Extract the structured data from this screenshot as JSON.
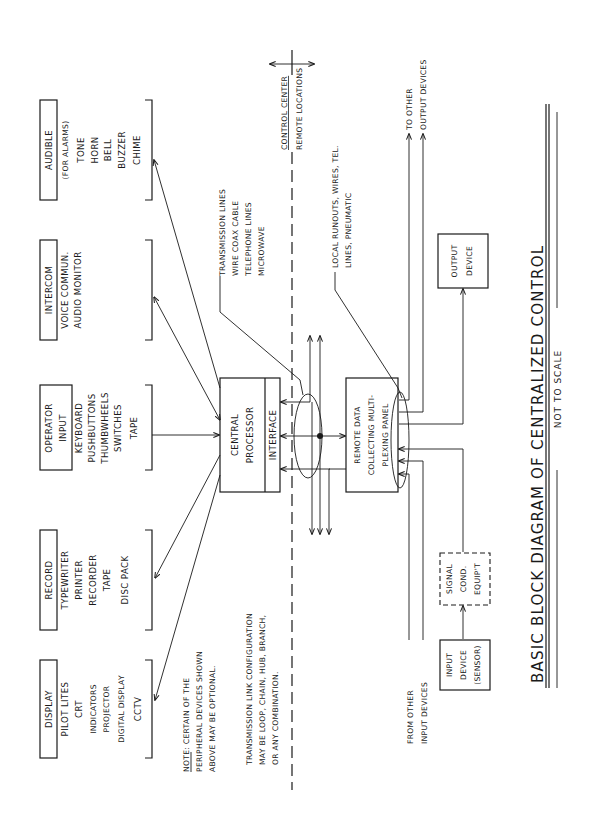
{
  "title": "BASIC BLOCK DIAGRAM OF CENTRALIZED CONTROL",
  "subtitle": "NOT TO SCALE",
  "orientation": "rotated 90° counter-clockwise",
  "peripherals": {
    "audible": {
      "heading": "AUDIBLE",
      "lines": [
        "(FOR ALARMS)",
        "TONE",
        "HORN",
        "BELL",
        "BUZZER",
        "CHIME"
      ]
    },
    "intercom": {
      "heading": "INTERCOM",
      "lines": [
        "VOICE COMMUN.",
        "AUDIO MONITOR"
      ]
    },
    "operator_input": {
      "heading": [
        "OPERATOR",
        "INPUT"
      ],
      "lines": [
        "KEYBOARD",
        "PUSHBUTTONS",
        "THUMBWHEELS",
        "SWITCHES",
        "TAPE"
      ]
    },
    "record": {
      "heading": "RECORD",
      "lines": [
        "TYPEWRITER",
        "PRINTER",
        "RECORDER",
        "TAPE",
        "DISC PACK"
      ]
    },
    "display": {
      "heading": "DISPLAY",
      "lines": [
        "PILOT LITES",
        "CRT",
        "INDICATORS",
        "PROJECTOR",
        "DIGITAL DISPLAY",
        "CCTV"
      ]
    }
  },
  "central": {
    "processor": [
      "CENTRAL",
      "PROCESSOR"
    ],
    "interface": "INTERFACE"
  },
  "remote_panel": [
    "REMOTE DATA",
    "COLLECTING MULTI-",
    "PLEXING PANEL"
  ],
  "output_device": [
    "OUTPUT",
    "DEVICE"
  ],
  "signal_cond": [
    "SIGNAL",
    "COND.",
    "EQUIP'T"
  ],
  "input_device": [
    "INPUT",
    "DEVICE",
    "(SENSOR)"
  ],
  "notes": {
    "peripheral_note": [
      "NOTE: CERTAIN OF THE",
      "PERIPHERAL DEVICES SHOWN",
      "ABOVE MAY BE OPTIONAL."
    ],
    "note_prefix": "NOTE:",
    "link_config": [
      "TRANSMISSION LINK CONFIGURATION",
      "MAY BE LOOP, CHAIN, HUB, BRANCH,",
      "OR ANY COMBINATION."
    ],
    "transmission_lines": [
      "TRANSMISSION LINES",
      "WIRE COAX CABLE",
      "TELEPHONE LINES",
      "MICROWAVE"
    ],
    "local_runouts": [
      "LOCAL RUNOUTS, WIRES, TEL.",
      "LINES, PNEUMATIC"
    ],
    "to_other_outputs": [
      "TO OTHER",
      "OUTPUT DEVICES"
    ],
    "from_other_inputs": [
      "FROM OTHER",
      "INPUT DEVICES"
    ],
    "boundary": {
      "upper": "CONTROL CENTER",
      "lower": "REMOTE LOCATIONS"
    }
  }
}
